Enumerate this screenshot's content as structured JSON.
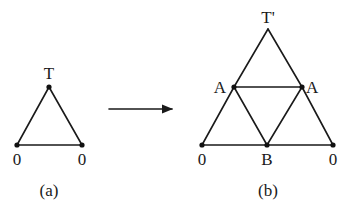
{
  "colors": {
    "line": "#1a1a1a",
    "node": "#111111",
    "background": "#ffffff"
  },
  "panels": [
    {
      "id": "a",
      "caption": "(a)",
      "caption_pos": [
        49,
        196
      ],
      "nodes": [
        {
          "id": "T",
          "label": "T",
          "x": 49,
          "y": 87,
          "label_x": 49,
          "label_y": 79,
          "anchor": "middle"
        },
        {
          "id": "L0",
          "label": "0",
          "x": 17,
          "y": 145,
          "label_x": 17,
          "label_y": 165,
          "anchor": "middle"
        },
        {
          "id": "R0",
          "label": "0",
          "x": 82,
          "y": 145,
          "label_x": 82,
          "label_y": 165,
          "anchor": "middle"
        }
      ],
      "edges": [
        [
          "T",
          "L0"
        ],
        [
          "T",
          "R0"
        ],
        [
          "L0",
          "R0"
        ]
      ]
    },
    {
      "id": "b",
      "caption": "(b)",
      "caption_pos": [
        268,
        196
      ],
      "nodes": [
        {
          "id": "Tp",
          "label": "T'",
          "x": 268,
          "y": 29,
          "label_x": 268,
          "label_y": 23,
          "anchor": "middle",
          "dot": false
        },
        {
          "id": "AL",
          "label": "A",
          "x": 234,
          "y": 87,
          "label_x": 226,
          "label_y": 93,
          "anchor": "end"
        },
        {
          "id": "AR",
          "label": "A",
          "x": 302,
          "y": 87,
          "label_x": 306,
          "label_y": 93,
          "anchor": "start"
        },
        {
          "id": "L0",
          "label": "0",
          "x": 202,
          "y": 145,
          "label_x": 202,
          "label_y": 165,
          "anchor": "middle"
        },
        {
          "id": "B",
          "label": "B",
          "x": 267,
          "y": 145,
          "label_x": 267,
          "label_y": 165,
          "anchor": "middle"
        },
        {
          "id": "R0",
          "label": "0",
          "x": 333,
          "y": 145,
          "label_x": 333,
          "label_y": 165,
          "anchor": "middle"
        }
      ],
      "edges": [
        [
          "Tp",
          "AL"
        ],
        [
          "Tp",
          "AR"
        ],
        [
          "AL",
          "AR"
        ],
        [
          "AL",
          "L0"
        ],
        [
          "AL",
          "B"
        ],
        [
          "AR",
          "B"
        ],
        [
          "AR",
          "R0"
        ],
        [
          "L0",
          "B"
        ],
        [
          "B",
          "R0"
        ]
      ]
    }
  ],
  "arrow": {
    "from": [
      109,
      109
    ],
    "to": [
      172,
      109
    ],
    "meaning": "transforms-to"
  }
}
